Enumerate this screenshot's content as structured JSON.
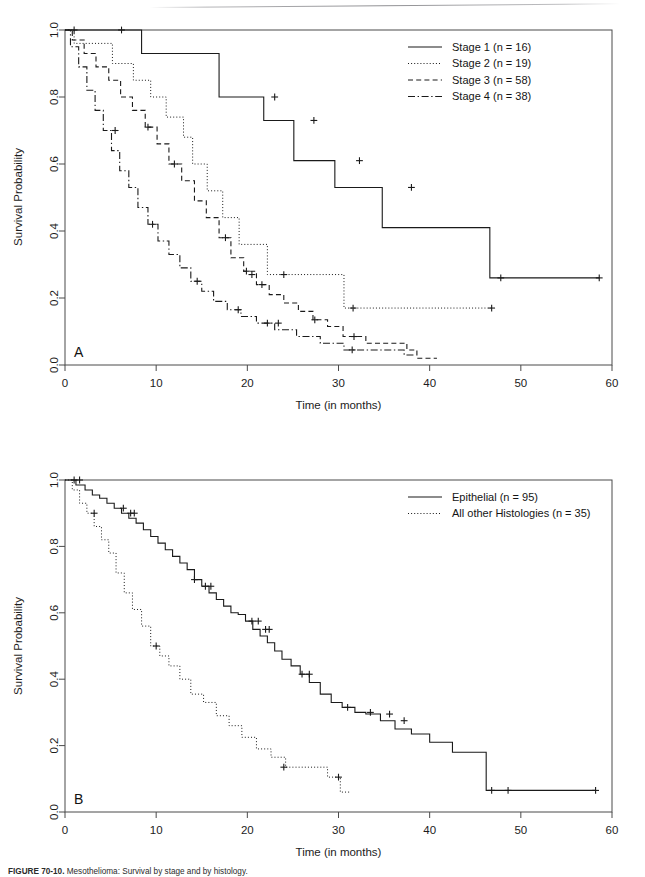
{
  "figure": {
    "caption_prefix": "FIGURE 70-10.",
    "caption_text": "Mesothelioma: Survival by stage and by histology.",
    "panel_a_letter": "A",
    "panel_b_letter": "B",
    "background_color": "#ffffff",
    "ink_color": "#1a1a1a"
  },
  "chart_data": [
    {
      "type": "line",
      "id": "panel-a",
      "title": "",
      "panel_label": "A",
      "xlabel": "Time (in months)",
      "ylabel": "Survival Probability",
      "xlim": [
        0,
        60
      ],
      "ylim": [
        0.0,
        1.0
      ],
      "xticks": [
        0,
        10,
        20,
        30,
        40,
        50,
        60
      ],
      "xticklabels": [
        "0",
        "10",
        "20",
        "30",
        "40",
        "50",
        "60"
      ],
      "yticks": [
        0.0,
        0.2,
        0.4,
        0.6,
        0.8,
        1.0
      ],
      "yticklabels": [
        "0.0",
        "0.2",
        "0.4",
        "0.6",
        "0.8",
        "1.0"
      ],
      "grid": false,
      "legend_position": "top-right",
      "series": [
        {
          "name": "Stage 1 (n = 16)",
          "linestyle": "solid",
          "n": 16,
          "x": [
            0,
            8.4,
            8.4,
            16.9,
            16.9,
            21.8,
            21.8,
            25.1,
            25.1,
            29.6,
            29.6,
            34.8,
            34.8,
            46.6,
            46.6,
            58.6
          ],
          "y": [
            1.0,
            1.0,
            0.93,
            0.93,
            0.8,
            0.8,
            0.73,
            0.73,
            0.61,
            0.61,
            0.53,
            0.53,
            0.41,
            0.41,
            0.26,
            0.26
          ],
          "censor_x": [
            1.0,
            6.2,
            23.0,
            27.3,
            32.3,
            38.0,
            47.8,
            58.6
          ],
          "censor_y": [
            1.0,
            1.0,
            0.8,
            0.73,
            0.61,
            0.53,
            0.26,
            0.26
          ]
        },
        {
          "name": "Stage 2 (n = 19)",
          "linestyle": "dotted",
          "n": 19,
          "x": [
            0,
            1.0,
            1.0,
            5.2,
            5.2,
            7.5,
            7.5,
            9.4,
            9.4,
            11.1,
            11.1,
            13.0,
            13.0,
            14.0,
            14.0,
            15.6,
            15.6,
            17.3,
            17.3,
            19.1,
            19.1,
            22.2,
            22.2,
            30.6,
            30.6,
            47.0
          ],
          "y": [
            1.0,
            1.0,
            0.96,
            0.96,
            0.9,
            0.9,
            0.85,
            0.85,
            0.8,
            0.8,
            0.74,
            0.74,
            0.68,
            0.68,
            0.6,
            0.6,
            0.52,
            0.52,
            0.44,
            0.44,
            0.36,
            0.36,
            0.27,
            0.27,
            0.17,
            0.17
          ],
          "censor_x": [
            20.5,
            24.0,
            31.6,
            46.8
          ],
          "censor_y": [
            0.27,
            0.27,
            0.17,
            0.17
          ]
        },
        {
          "name": "Stage 3 (n = 58)",
          "linestyle": "dashed",
          "n": 58,
          "x": [
            0,
            0.8,
            0.8,
            2.1,
            2.1,
            3.4,
            3.4,
            4.8,
            4.8,
            6.1,
            6.1,
            7.4,
            7.4,
            8.8,
            8.8,
            10.1,
            10.1,
            11.4,
            11.4,
            12.8,
            12.8,
            14.2,
            14.2,
            15.5,
            15.5,
            16.9,
            16.9,
            18.2,
            18.2,
            19.6,
            19.6,
            21.0,
            21.0,
            22.4,
            22.4,
            24.0,
            24.0,
            25.6,
            25.6,
            27.2,
            27.2,
            28.8,
            28.8,
            30.5,
            30.5,
            33.0,
            33.0,
            37.5,
            37.5,
            38.6,
            38.6,
            40.8
          ],
          "y": [
            1.0,
            1.0,
            0.97,
            0.97,
            0.93,
            0.93,
            0.89,
            0.89,
            0.85,
            0.85,
            0.8,
            0.8,
            0.76,
            0.76,
            0.71,
            0.71,
            0.66,
            0.66,
            0.6,
            0.6,
            0.55,
            0.55,
            0.49,
            0.49,
            0.44,
            0.44,
            0.38,
            0.38,
            0.32,
            0.32,
            0.28,
            0.28,
            0.24,
            0.24,
            0.21,
            0.21,
            0.185,
            0.185,
            0.16,
            0.16,
            0.135,
            0.135,
            0.115,
            0.115,
            0.085,
            0.085,
            0.065,
            0.065,
            0.045,
            0.045,
            0.02,
            0.02
          ],
          "censor_x": [
            9.1,
            12.0,
            17.6,
            19.9,
            21.6,
            27.4,
            31.7
          ],
          "censor_y": [
            0.71,
            0.6,
            0.38,
            0.28,
            0.24,
            0.135,
            0.085
          ]
        },
        {
          "name": "Stage 4 (n = 38)",
          "linestyle": "dashdot",
          "n": 38,
          "x": [
            0,
            0.6,
            0.6,
            1.5,
            1.5,
            2.4,
            2.4,
            3.3,
            3.3,
            4.2,
            4.2,
            5.1,
            5.1,
            6.0,
            6.0,
            7.0,
            7.0,
            8.0,
            8.0,
            9.1,
            9.1,
            10.2,
            10.2,
            11.4,
            11.4,
            12.6,
            12.6,
            13.8,
            13.8,
            15.0,
            15.0,
            16.3,
            16.3,
            17.8,
            17.8,
            19.3,
            19.3,
            21.0,
            21.0,
            23.0,
            23.0,
            25.4,
            25.4,
            28.0,
            28.0,
            30.6,
            30.6,
            37.2,
            37.2,
            38.4
          ],
          "y": [
            1.0,
            1.0,
            0.95,
            0.95,
            0.89,
            0.89,
            0.82,
            0.82,
            0.76,
            0.76,
            0.7,
            0.7,
            0.64,
            0.64,
            0.58,
            0.58,
            0.53,
            0.53,
            0.47,
            0.47,
            0.42,
            0.42,
            0.37,
            0.37,
            0.33,
            0.33,
            0.29,
            0.29,
            0.25,
            0.25,
            0.22,
            0.22,
            0.19,
            0.19,
            0.165,
            0.165,
            0.145,
            0.145,
            0.125,
            0.125,
            0.105,
            0.105,
            0.085,
            0.085,
            0.065,
            0.065,
            0.045,
            0.045,
            0.03,
            0.03
          ],
          "censor_x": [
            5.5,
            9.6,
            14.5,
            19.0,
            22.2,
            23.4,
            31.5
          ],
          "censor_y": [
            0.7,
            0.42,
            0.25,
            0.165,
            0.125,
            0.125,
            0.045
          ]
        }
      ]
    },
    {
      "type": "line",
      "id": "panel-b",
      "title": "",
      "panel_label": "B",
      "xlabel": "Time (in months)",
      "ylabel": "Survival Probability",
      "xlim": [
        0,
        60
      ],
      "ylim": [
        0.0,
        1.0
      ],
      "xticks": [
        0,
        10,
        20,
        30,
        40,
        50,
        60
      ],
      "xticklabels": [
        "0",
        "10",
        "20",
        "30",
        "40",
        "50",
        "60"
      ],
      "yticks": [
        0.0,
        0.2,
        0.4,
        0.6,
        0.8,
        1.0
      ],
      "yticklabels": [
        "0.0",
        "0.2",
        "0.4",
        "0.6",
        "0.8",
        "1.0"
      ],
      "grid": false,
      "legend_position": "top-right",
      "series": [
        {
          "name": "Epithelial (n = 95)",
          "linestyle": "solid",
          "n": 95,
          "x": [
            0,
            1.2,
            1.2,
            2.2,
            2.2,
            3.0,
            3.0,
            3.8,
            3.8,
            4.6,
            4.6,
            5.4,
            5.4,
            6.2,
            6.2,
            7.0,
            7.0,
            7.8,
            7.8,
            8.6,
            8.6,
            9.4,
            9.4,
            10.2,
            10.2,
            11.0,
            11.0,
            11.8,
            11.8,
            12.6,
            12.6,
            13.4,
            13.4,
            14.2,
            14.2,
            15.0,
            15.0,
            15.8,
            15.8,
            16.6,
            16.6,
            17.4,
            17.4,
            18.2,
            18.2,
            19.0,
            19.0,
            19.8,
            19.8,
            20.6,
            20.6,
            21.4,
            21.4,
            22.2,
            22.2,
            23.0,
            23.0,
            23.8,
            23.8,
            24.8,
            24.8,
            25.8,
            25.8,
            26.8,
            26.8,
            28.0,
            28.0,
            29.2,
            29.2,
            30.4,
            30.4,
            31.8,
            31.8,
            33.0,
            33.0,
            34.6,
            34.6,
            36.2,
            36.2,
            38.0,
            38.0,
            40.0,
            40.0,
            42.5,
            42.5,
            46.2,
            46.2,
            58.2
          ],
          "y": [
            1.0,
            1.0,
            0.985,
            0.985,
            0.97,
            0.97,
            0.955,
            0.955,
            0.945,
            0.945,
            0.93,
            0.93,
            0.915,
            0.915,
            0.9,
            0.9,
            0.885,
            0.885,
            0.87,
            0.87,
            0.85,
            0.85,
            0.83,
            0.83,
            0.81,
            0.81,
            0.79,
            0.79,
            0.77,
            0.77,
            0.75,
            0.75,
            0.73,
            0.73,
            0.7,
            0.7,
            0.68,
            0.68,
            0.66,
            0.66,
            0.64,
            0.64,
            0.62,
            0.62,
            0.6,
            0.6,
            0.595,
            0.595,
            0.575,
            0.575,
            0.55,
            0.55,
            0.53,
            0.53,
            0.51,
            0.51,
            0.485,
            0.485,
            0.46,
            0.46,
            0.44,
            0.44,
            0.415,
            0.415,
            0.39,
            0.39,
            0.355,
            0.355,
            0.33,
            0.33,
            0.315,
            0.315,
            0.3,
            0.3,
            0.295,
            0.295,
            0.275,
            0.275,
            0.25,
            0.25,
            0.235,
            0.235,
            0.21,
            0.21,
            0.18,
            0.18,
            0.065,
            0.065
          ],
          "censor_x": [
            1.0,
            1.6,
            6.4,
            7.2,
            7.6,
            14.2,
            15.4,
            16.0,
            20.5,
            21.2,
            22.0,
            22.4,
            26.0,
            26.8,
            31.0,
            33.5,
            35.6,
            37.2,
            46.8,
            48.6,
            58.2
          ],
          "censor_y": [
            1.0,
            1.0,
            0.915,
            0.9,
            0.9,
            0.7,
            0.68,
            0.68,
            0.575,
            0.575,
            0.55,
            0.55,
            0.415,
            0.415,
            0.315,
            0.3,
            0.295,
            0.275,
            0.065,
            0.065,
            0.065
          ]
        },
        {
          "name": "All other Histologies (n = 35)",
          "linestyle": "dotted",
          "n": 35,
          "x": [
            0,
            0.8,
            0.8,
            1.6,
            1.6,
            2.4,
            2.4,
            3.2,
            3.2,
            4.0,
            4.0,
            4.8,
            4.8,
            5.6,
            5.6,
            6.5,
            6.5,
            7.4,
            7.4,
            8.4,
            8.4,
            9.4,
            9.4,
            10.4,
            10.4,
            11.4,
            11.4,
            12.6,
            12.6,
            13.8,
            13.8,
            15.2,
            15.2,
            16.6,
            16.6,
            18.0,
            18.0,
            19.4,
            19.4,
            21.0,
            21.0,
            22.6,
            22.6,
            24.2,
            24.2,
            26.0,
            26.0,
            28.8,
            28.8,
            30.2,
            30.2,
            31.2
          ],
          "y": [
            1.0,
            1.0,
            0.97,
            0.97,
            0.93,
            0.93,
            0.9,
            0.9,
            0.86,
            0.86,
            0.82,
            0.82,
            0.78,
            0.78,
            0.72,
            0.72,
            0.66,
            0.66,
            0.61,
            0.61,
            0.56,
            0.56,
            0.5,
            0.5,
            0.47,
            0.47,
            0.44,
            0.44,
            0.4,
            0.4,
            0.355,
            0.355,
            0.33,
            0.33,
            0.29,
            0.29,
            0.26,
            0.26,
            0.225,
            0.225,
            0.19,
            0.19,
            0.165,
            0.165,
            0.135,
            0.135,
            0.135,
            0.135,
            0.105,
            0.105,
            0.06,
            0.06
          ],
          "censor_x": [
            3.2,
            10.0,
            24.0,
            30.0
          ],
          "censor_y": [
            0.9,
            0.5,
            0.135,
            0.105
          ]
        }
      ]
    }
  ],
  "panel_a": {
    "letter": "A",
    "legend": {
      "entries": [
        {
          "label": "Stage 1 (n = 16)",
          "style": "solid"
        },
        {
          "label": "Stage 2 (n = 19)",
          "style": "dotted"
        },
        {
          "label": "Stage 3 (n = 58)",
          "style": "dashed"
        },
        {
          "label": "Stage 4 (n = 38)",
          "style": "dashdot"
        }
      ]
    },
    "axis": {
      "x_title": "Time (in months)",
      "y_title": "Survival Probability",
      "x_ticks": [
        "0",
        "10",
        "20",
        "30",
        "40",
        "50",
        "60"
      ],
      "y_ticks": [
        "0.0",
        "0.2",
        "0.4",
        "0.6",
        "0.8",
        "1.0"
      ]
    }
  },
  "panel_b": {
    "letter": "B",
    "legend": {
      "entries": [
        {
          "label": "Epithelial (n = 95)",
          "style": "solid"
        },
        {
          "label": "All other Histologies (n = 35)",
          "style": "dotted"
        }
      ]
    },
    "axis": {
      "x_title": "Time (in months)",
      "y_title": "Survival Probability",
      "x_ticks": [
        "0",
        "10",
        "20",
        "30",
        "40",
        "50",
        "60"
      ],
      "y_ticks": [
        "0.0",
        "0.2",
        "0.4",
        "0.6",
        "0.8",
        "1.0"
      ]
    }
  }
}
